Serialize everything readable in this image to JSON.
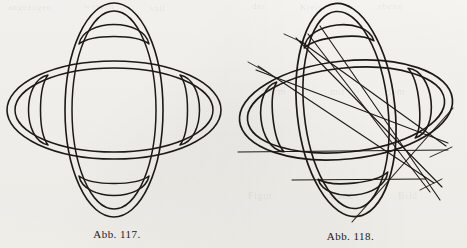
{
  "page": {
    "width": 467,
    "height": 248,
    "background_color": "#f6f5f2",
    "ink_color": "#1d1a16"
  },
  "bleed_through_text": [
    {
      "text": "angezogen",
      "x": 8,
      "y": 2,
      "size": 9
    },
    {
      "text": "werden",
      "x": 84,
      "y": 1,
      "size": 9
    },
    {
      "text": "soll",
      "x": 150,
      "y": 3,
      "size": 9
    },
    {
      "text": "der",
      "x": 252,
      "y": 1,
      "size": 9
    },
    {
      "text": "Kreis",
      "x": 300,
      "y": 2,
      "size": 9
    },
    {
      "text": "ebene",
      "x": 378,
      "y": 1,
      "size": 9
    },
    {
      "text": "Form",
      "x": 262,
      "y": 86,
      "size": 10
    },
    {
      "text": "mit",
      "x": 330,
      "y": 86,
      "size": 10
    },
    {
      "text": "dem",
      "x": 386,
      "y": 86,
      "size": 10
    },
    {
      "text": "Figur",
      "x": 248,
      "y": 190,
      "size": 10
    },
    {
      "text": "Rand",
      "x": 330,
      "y": 190,
      "size": 10
    },
    {
      "text": "Bild",
      "x": 398,
      "y": 190,
      "size": 10
    }
  ],
  "figures": [
    {
      "id": "fig-117",
      "caption": "Abb. 117.",
      "name": "four-lobed-rosette-plain",
      "center": {
        "x": 114,
        "y": 110
      },
      "geometry": {
        "type": "two-intersecting-ellipses-rosette",
        "outer_horizontal_ellipse": {
          "rx": 108,
          "ry": 49
        },
        "outer_vertical_ellipse": {
          "rx": 49,
          "ry": 108
        },
        "inner_horizontal_ellipse": {
          "rx": 100,
          "ry": 42
        },
        "inner_vertical_ellipse": {
          "rx": 42,
          "ry": 100
        },
        "lobes": 4,
        "lobe_inner_crescents": 4,
        "central_region": "rounded-square"
      },
      "straight_lines": []
    },
    {
      "id": "fig-118",
      "caption": "Abb. 118.",
      "name": "four-lobed-rosette-with-construction-lines",
      "center": {
        "x": 112,
        "y": 110
      },
      "geometry": {
        "type": "two-intersecting-ellipses-rosette",
        "outer_horizontal_ellipse": {
          "rx": 108,
          "ry": 49
        },
        "outer_vertical_ellipse": {
          "rx": 49,
          "ry": 108
        },
        "inner_horizontal_ellipse": {
          "rx": 100,
          "ry": 42
        },
        "inner_vertical_ellipse": {
          "rx": 42,
          "ry": 100
        },
        "lobes": 4,
        "lobe_inner_crescents": 4,
        "central_region": "rounded-square",
        "rotation_deg": -6
      },
      "straight_lines": [
        {
          "name": "tangent-upper-left-long",
          "x1": 62,
          "y1": 38,
          "x2": 208,
          "y2": 187
        },
        {
          "name": "chord-upper-left-to-right",
          "x1": 66,
          "y1": 41,
          "x2": 212,
          "y2": 146
        },
        {
          "name": "chord-left-to-lower-right",
          "x1": 24,
          "y1": 66,
          "x2": 200,
          "y2": 183
        },
        {
          "name": "chord-left-to-right-flat",
          "x1": 22,
          "y1": 70,
          "x2": 214,
          "y2": 143
        },
        {
          "name": "long-diagonal-top-to-bottom",
          "x1": 86,
          "y1": 26,
          "x2": 206,
          "y2": 200
        },
        {
          "name": "diagonal-right-to-lower-left",
          "x1": 219,
          "y1": 108,
          "x2": 118,
          "y2": 222
        },
        {
          "name": "diagonal-steep-left",
          "x1": 74,
          "y1": 34,
          "x2": 196,
          "y2": 192
        },
        {
          "name": "horizontal-upper",
          "x1": 4,
          "y1": 152,
          "x2": 214,
          "y2": 150
        },
        {
          "name": "horizontal-lower",
          "x1": 58,
          "y1": 180,
          "x2": 192,
          "y2": 179
        },
        {
          "name": "tick-left-upper",
          "x1": 50,
          "y1": 34,
          "x2": 72,
          "y2": 44
        },
        {
          "name": "tick-left-middle",
          "x1": 14,
          "y1": 62,
          "x2": 36,
          "y2": 74
        },
        {
          "name": "tick-right-lower",
          "x1": 196,
          "y1": 157,
          "x2": 218,
          "y2": 147
        },
        {
          "name": "tick-bottom-right",
          "x1": 186,
          "y1": 190,
          "x2": 208,
          "y2": 179
        }
      ]
    }
  ]
}
